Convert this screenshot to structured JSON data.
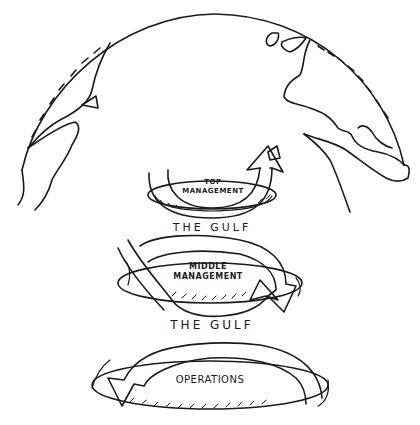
{
  "illustration": {
    "subject": "globe with organizational tiers",
    "ink_color": "#1a1a1a",
    "background": "#ffffff"
  },
  "tiers": [
    {
      "id": "top",
      "label_line1": "TOP",
      "label_line2": "MANAGEMENT"
    },
    {
      "id": "middle",
      "label_line1": "MIDDLE",
      "label_line2": "MANAGEMENT"
    },
    {
      "id": "operations",
      "label_line1": "OPERATIONS"
    }
  ],
  "gulfs": [
    {
      "label": "THE GULF"
    },
    {
      "label": "THE GULF"
    }
  ]
}
